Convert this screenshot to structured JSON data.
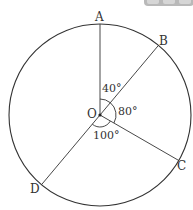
{
  "diagram": {
    "type": "circle-central-angles",
    "center": {
      "label": "O",
      "x": 100,
      "y": 115
    },
    "radius": 91,
    "points": [
      {
        "label": "A",
        "angle_from_top_deg": 0
      },
      {
        "label": "B",
        "angle_from_top_deg": 40
      },
      {
        "label": "C",
        "angle_from_top_deg": 120
      },
      {
        "label": "D",
        "angle_from_top_deg": 220
      }
    ],
    "angles": [
      {
        "between": "AOB",
        "label": "40°"
      },
      {
        "between": "BOC",
        "label": "80°"
      },
      {
        "between": "COD",
        "label": "100°"
      }
    ],
    "labels": {
      "A": "A",
      "B": "B",
      "C": "C",
      "D": "D",
      "O": "O",
      "angle_AOB": "40°",
      "angle_BOC": "80°",
      "angle_COD": "100°"
    },
    "colors": {
      "stroke": "#333333",
      "background": "#ffffff",
      "badge": "#b9b9b9"
    }
  }
}
